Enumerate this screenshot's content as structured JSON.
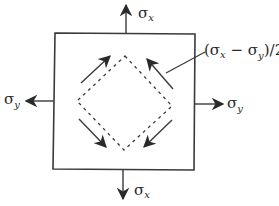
{
  "diagram": {
    "type": "plane-stress-element",
    "colors": {
      "line": "#3a3a3a",
      "text": "#2a2a2a",
      "background": "#ffffff"
    },
    "element_box": {
      "x1": 53,
      "y1": 33,
      "x2": 195,
      "y2": 170
    },
    "rotated_element": {
      "style": "dashed",
      "vertices": {
        "top": [
          125,
          56
        ],
        "right": [
          172,
          106
        ],
        "bottom": [
          124,
          150
        ],
        "left": [
          77,
          101
        ]
      }
    },
    "normal_stress_arrows": [
      {
        "id": "top",
        "direction": "up",
        "symbol": "σ",
        "subscript": "x"
      },
      {
        "id": "bottom",
        "direction": "down",
        "symbol": "σ",
        "subscript": "x"
      },
      {
        "id": "left",
        "direction": "left",
        "symbol": "σ",
        "subscript": "y"
      },
      {
        "id": "right",
        "direction": "right",
        "symbol": "σ",
        "subscript": "y"
      }
    ],
    "shear_arrows": [
      {
        "id": "upper-left",
        "direction": "up-right"
      },
      {
        "id": "upper-right",
        "direction": "up-left"
      },
      {
        "id": "lower-left",
        "direction": "down-right"
      },
      {
        "id": "lower-right",
        "direction": "down-left"
      }
    ],
    "labels": {
      "top": {
        "symbol": "σ",
        "subscript": "x"
      },
      "bottom": {
        "symbol": "σ",
        "subscript": "x"
      },
      "left": {
        "symbol": "σ",
        "subscript": "y"
      },
      "right": {
        "symbol": "σ",
        "subscript": "y"
      },
      "shear": {
        "open": "(σ",
        "sub1": "x",
        "minus": " − σ",
        "sub2": "y",
        "close": ")/2"
      }
    }
  }
}
